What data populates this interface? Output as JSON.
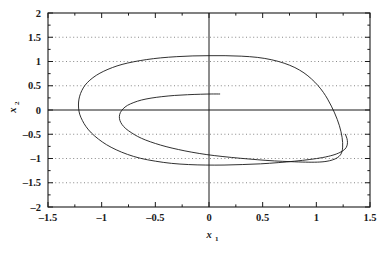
{
  "chart_data": {
    "type": "line",
    "title": "",
    "subtitle": "",
    "xlabel": "x",
    "xlabel_sub": "1",
    "ylabel": "x",
    "ylabel_sub": "2",
    "xlim": [
      -1.5,
      1.5
    ],
    "ylim": [
      -2,
      2
    ],
    "xticks": [
      -1.5,
      -1,
      -0.5,
      0,
      0.5,
      1,
      1.5
    ],
    "yticks": [
      -2,
      -1.5,
      -1,
      -0.5,
      0,
      0.5,
      1,
      1.5,
      2
    ],
    "xtick_labels": [
      "-1.5",
      "-1",
      "-0.5",
      "0",
      "0.5",
      "1",
      "1.5"
    ],
    "ytick_labels": [
      "-2",
      "-1.5",
      "-1",
      "-0.5",
      "0",
      "0.5",
      "1",
      "1.5",
      "2"
    ],
    "x_minor_tick_interval": 0.25,
    "y_minor_tick_interval": 0.25,
    "grid": true,
    "grid_style": "dotted",
    "grid_color": "#555555",
    "axis_color": "#1a1a1a",
    "line_color": "#1a1a1a",
    "legend": null,
    "legend_position": "none",
    "annotations": [],
    "series": [
      {
        "name": "trajectory",
        "points": [
          [
            0.1,
            0.33
          ],
          [
            0.02,
            0.33
          ],
          [
            -0.08,
            0.325
          ],
          [
            -0.2,
            0.315
          ],
          [
            -0.32,
            0.3
          ],
          [
            -0.44,
            0.275
          ],
          [
            -0.54,
            0.245
          ],
          [
            -0.63,
            0.205
          ],
          [
            -0.7,
            0.155
          ],
          [
            -0.76,
            0.095
          ],
          [
            -0.8,
            0.025
          ],
          [
            -0.825,
            -0.05
          ],
          [
            -0.835,
            -0.13
          ],
          [
            -0.83,
            -0.215
          ],
          [
            -0.81,
            -0.3
          ],
          [
            -0.775,
            -0.385
          ],
          [
            -0.725,
            -0.465
          ],
          [
            -0.665,
            -0.545
          ],
          [
            -0.59,
            -0.62
          ],
          [
            -0.5,
            -0.69
          ],
          [
            -0.4,
            -0.755
          ],
          [
            -0.285,
            -0.815
          ],
          [
            -0.16,
            -0.87
          ],
          [
            -0.02,
            -0.92
          ],
          [
            0.13,
            -0.96
          ],
          [
            0.29,
            -0.995
          ],
          [
            0.45,
            -1.025
          ],
          [
            0.61,
            -1.05
          ],
          [
            0.76,
            -1.065
          ],
          [
            0.9,
            -1.075
          ],
          [
            1.01,
            -1.075
          ],
          [
            1.09,
            -1.06
          ],
          [
            1.15,
            -1.03
          ],
          [
            1.195,
            -0.985
          ],
          [
            1.225,
            -0.925
          ],
          [
            1.24,
            -0.85
          ],
          [
            1.245,
            -0.765
          ],
          [
            1.245,
            -0.67
          ],
          [
            1.24,
            -0.565
          ],
          [
            1.23,
            -0.45
          ],
          [
            1.215,
            -0.325
          ],
          [
            1.195,
            -0.195
          ],
          [
            1.17,
            -0.06
          ],
          [
            1.14,
            0.08
          ],
          [
            1.105,
            0.225
          ],
          [
            1.065,
            0.365
          ],
          [
            1.015,
            0.505
          ],
          [
            0.955,
            0.64
          ],
          [
            0.885,
            0.765
          ],
          [
            0.8,
            0.875
          ],
          [
            0.7,
            0.965
          ],
          [
            0.585,
            1.035
          ],
          [
            0.45,
            1.085
          ],
          [
            0.3,
            1.11
          ],
          [
            0.15,
            1.12
          ],
          [
            0.0,
            1.12
          ],
          [
            -0.15,
            1.115
          ],
          [
            -0.3,
            1.1
          ],
          [
            -0.45,
            1.075
          ],
          [
            -0.58,
            1.04
          ],
          [
            -0.7,
            0.995
          ],
          [
            -0.81,
            0.94
          ],
          [
            -0.9,
            0.875
          ],
          [
            -0.98,
            0.8
          ],
          [
            -1.05,
            0.715
          ],
          [
            -1.11,
            0.615
          ],
          [
            -1.155,
            0.51
          ],
          [
            -1.185,
            0.4
          ],
          [
            -1.205,
            0.285
          ],
          [
            -1.215,
            0.165
          ],
          [
            -1.215,
            0.04
          ],
          [
            -1.205,
            -0.085
          ],
          [
            -1.18,
            -0.215
          ],
          [
            -1.145,
            -0.345
          ],
          [
            -1.095,
            -0.475
          ],
          [
            -1.03,
            -0.6
          ],
          [
            -0.955,
            -0.715
          ],
          [
            -0.865,
            -0.82
          ],
          [
            -0.76,
            -0.915
          ],
          [
            -0.64,
            -0.995
          ],
          [
            -0.5,
            -1.055
          ],
          [
            -0.35,
            -1.1
          ],
          [
            -0.19,
            -1.125
          ],
          [
            -0.03,
            -1.135
          ],
          [
            0.14,
            -1.135
          ],
          [
            0.31,
            -1.125
          ],
          [
            0.48,
            -1.11
          ],
          [
            0.645,
            -1.085
          ],
          [
            0.8,
            -1.055
          ],
          [
            0.94,
            -1.02
          ],
          [
            1.06,
            -0.98
          ],
          [
            1.155,
            -0.93
          ],
          [
            1.22,
            -0.875
          ],
          [
            1.265,
            -0.81
          ],
          [
            1.285,
            -0.74
          ],
          [
            1.29,
            -0.665
          ],
          [
            1.285,
            -0.585
          ],
          [
            1.27,
            -0.5
          ]
        ]
      }
    ]
  },
  "plot_geometry": {
    "frame_left": 48,
    "frame_right": 370,
    "frame_top": 13,
    "frame_bottom": 207
  }
}
